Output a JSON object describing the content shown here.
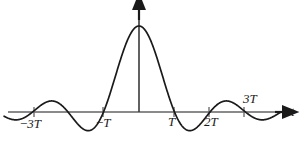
{
  "figure": {
    "kind": "sinc-function-plot",
    "background_color": "#ffffff",
    "width": 302,
    "height": 144
  },
  "axes": {
    "horizontal": {
      "label": "t",
      "color": "#8a8a8a",
      "y_pixel": 112,
      "x_start": 8,
      "x_end": 285,
      "arrow": "right"
    },
    "vertical": {
      "label": "",
      "color": "#1a1a1a",
      "x_pixel": 139,
      "y_top": 8,
      "y_bottom": 112,
      "arrow": "up"
    }
  },
  "ticks": [
    {
      "label": "−3T",
      "value": -3,
      "x_pixel": 34,
      "position": "below"
    },
    {
      "label": "−T",
      "value": -1,
      "x_pixel": 103,
      "position": "below"
    },
    {
      "label": "T",
      "value": 1,
      "x_pixel": 174,
      "position": "below"
    },
    {
      "label": "2T",
      "value": 2,
      "x_pixel": 209,
      "position": "below"
    },
    {
      "label": "3T",
      "value": 3,
      "x_pixel": 244,
      "position": "above"
    }
  ],
  "tick_labels": {
    "minus_3T_sign": "−",
    "minus_3T_var": "3T",
    "minus_T_sign": "−",
    "minus_T_var": "T",
    "T_var": "T",
    "two_T_var": "2T",
    "three_T_var": "3T",
    "t_axis": "t"
  },
  "chart_data": {
    "type": "line",
    "title": "",
    "subtitle": "",
    "xlabel": "t",
    "ylabel": "",
    "grid": false,
    "legend": null,
    "function": "sinc",
    "xlim": [
      -3.8,
      4.0
    ],
    "ylim": [
      -0.3,
      1.12
    ],
    "x_tick_values": [
      -3,
      -1,
      1,
      2,
      3
    ],
    "x_tick_labels": [
      "−3T",
      "−T",
      "T",
      "2T",
      "3T"
    ],
    "y_tick_values": [],
    "y_tick_labels": [],
    "zero_crossings": [
      -3,
      -2,
      -1,
      1,
      2,
      3
    ],
    "peak": {
      "x": 0,
      "y": 1.0
    },
    "side_lobes": [
      {
        "x": -2.46,
        "y": -0.217,
        "type": "minimum"
      },
      {
        "x": -1.43,
        "y": 0.217,
        "type": "maximum"
      },
      {
        "x": 1.43,
        "y": -0.217,
        "type": "minimum"
      },
      {
        "x": 2.46,
        "y": 0.128,
        "type": "maximum"
      }
    ],
    "series": [
      {
        "name": "sinc(t/T)",
        "color": "#1a1a1a",
        "x": [
          -3.8,
          -3.7,
          -3.6,
          -3.5,
          -3.4,
          -3.3,
          -3.2,
          -3.1,
          -3.0,
          -2.9,
          -2.8,
          -2.7,
          -2.6,
          -2.5,
          -2.4,
          -2.3,
          -2.2,
          -2.1,
          -2.0,
          -1.9,
          -1.8,
          -1.7,
          -1.6,
          -1.5,
          -1.4,
          -1.3,
          -1.2,
          -1.1,
          -1.0,
          -0.9,
          -0.8,
          -0.7,
          -0.6,
          -0.5,
          -0.4,
          -0.3,
          -0.2,
          -0.1,
          0.0,
          0.1,
          0.2,
          0.3,
          0.4,
          0.5,
          0.6,
          0.7,
          0.8,
          0.9,
          1.0,
          1.1,
          1.2,
          1.3,
          1.4,
          1.5,
          1.6,
          1.7,
          1.8,
          1.9,
          2.0,
          2.1,
          2.2,
          2.3,
          2.4,
          2.5,
          2.6,
          2.7,
          2.8,
          2.9,
          3.0,
          3.1,
          3.2,
          3.3,
          3.4,
          3.5,
          3.6,
          3.7,
          3.8
        ],
        "y": [
          -0.0789,
          -0.083,
          -0.0797,
          -0.0694,
          -0.053,
          -0.0321,
          -0.0085,
          0.0155,
          0.0,
          0.0355,
          0.0683,
          0.0962,
          0.117,
          0.1288,
          0.1305,
          0.1217,
          0.103,
          0.0756,
          0.0,
          0.0399,
          0.0,
          -0.0559,
          -0.1191,
          -0.1826,
          -0.2387,
          -0.2803,
          -0.3004,
          -0.2939,
          0.0,
          -0.1913,
          -0.0936,
          0.0302,
          0.172,
          0.3001,
          0.5046,
          0.6549,
          0.8003,
          0.9211,
          1.0,
          0.9211,
          0.8003,
          0.6549,
          0.5046,
          0.3001,
          0.172,
          0.0302,
          -0.0936,
          -0.1913,
          0.0,
          -0.2939,
          -0.3004,
          -0.2803,
          -0.2387,
          -0.1826,
          -0.1191,
          -0.0559,
          0.0,
          0.0399,
          0.0,
          0.0756,
          0.103,
          0.1217,
          0.1305,
          0.1288,
          0.117,
          0.0962,
          0.0683,
          0.0355,
          0.0,
          0.0155,
          -0.0085,
          -0.0321,
          -0.053,
          -0.0694,
          -0.0797,
          -0.083,
          -0.0789
        ]
      }
    ]
  }
}
